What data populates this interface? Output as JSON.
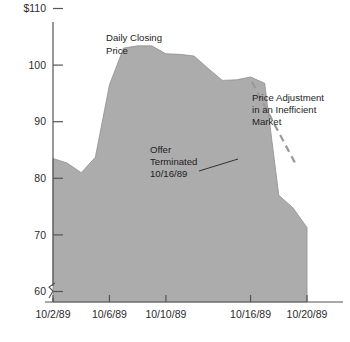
{
  "chart_data": {
    "type": "area",
    "title": "",
    "xlabel": "",
    "ylabel": "",
    "ylim": [
      55,
      112
    ],
    "grid": false,
    "legend_position": "none",
    "ytick_labels": [
      "$110",
      "100",
      "90",
      "80",
      "70",
      "60"
    ],
    "ytick_values": [
      110,
      100,
      90,
      80,
      70,
      60
    ],
    "xtick_labels": [
      "10/2/89",
      "10/6/89",
      "10/10/89",
      "10/16/89",
      "10/20/89"
    ],
    "xtick_values": [
      2,
      6,
      10,
      16,
      20
    ],
    "series": [
      {
        "name": "Daily Closing Price",
        "x": [
          2,
          3,
          4,
          5,
          6,
          7,
          8,
          9,
          10,
          11,
          12,
          13,
          14,
          15,
          16,
          17,
          18,
          19,
          20
        ],
        "values": [
          83.5,
          82.7,
          81.0,
          83.7,
          96.5,
          103.0,
          103.4,
          103.4,
          102.0,
          101.9,
          101.6,
          99.4,
          97.3,
          97.4,
          97.9,
          96.8,
          77.0,
          74.8,
          71.3
        ]
      }
    ],
    "annotations": [
      {
        "name": "series-label",
        "text_lines": [
          "Daily Closing",
          "Price"
        ],
        "x": 6,
        "y": 109
      },
      {
        "name": "offer-terminated-note",
        "text_lines": [
          "Offer",
          "Terminated",
          "10/16/89"
        ],
        "x": 10.5,
        "y": 86
      },
      {
        "name": "price-adjustment-note",
        "text_lines": [
          "Price Adjustment",
          "in an Inefficient",
          "Market"
        ],
        "x": 17,
        "y": 99
      }
    ],
    "guide_line": {
      "name": "price-adjustment-guide",
      "style": "dashed",
      "color": "#9a9a9a",
      "from": {
        "x": 16.1,
        "y": 97.0
      },
      "to": {
        "x": 19.2,
        "y": 82.5
      }
    },
    "axis_break": {
      "present": true,
      "axis": "y",
      "below_value": 58
    }
  },
  "colors": {
    "area": "#a8a8a8",
    "axis": "#555555",
    "text": "#1d1d1d",
    "guide": "#9a9a9a",
    "background": "#ffffff"
  }
}
